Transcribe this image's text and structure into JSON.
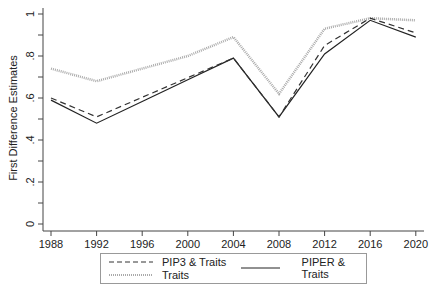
{
  "chart_data": {
    "type": "line",
    "title": "",
    "xlabel": "",
    "ylabel": "First Difference Estimates",
    "x": [
      1988,
      1992,
      1996,
      2000,
      2004,
      2008,
      2012,
      2016,
      2020
    ],
    "x_tick_labels": [
      "1988",
      "1992",
      "1996",
      "2000",
      "2004",
      "2008",
      "2012",
      "2016",
      "2020"
    ],
    "y_tick_labels": [
      "0",
      ".2",
      ".4",
      ".6",
      ".8",
      "1"
    ],
    "ylim": [
      0,
      1
    ],
    "grid": false,
    "legend_position": "bottom",
    "series": [
      {
        "name": "PIP3 & Traits",
        "style": "dashed",
        "color": "#333333",
        "values": [
          0.6,
          0.51,
          null,
          null,
          0.79,
          0.51,
          0.85,
          0.98,
          0.91
        ]
      },
      {
        "name": "PIPER & Traits",
        "style": "solid",
        "color": "#222222",
        "values": [
          0.59,
          0.48,
          null,
          null,
          0.79,
          0.51,
          0.81,
          0.97,
          0.89
        ]
      },
      {
        "name": "Traits",
        "style": "dotted",
        "color": "#aaaaaa",
        "values": [
          0.74,
          0.68,
          null,
          0.8,
          0.89,
          0.62,
          0.93,
          0.98,
          0.97
        ]
      }
    ]
  },
  "legend": {
    "items": [
      "PIP3 & Traits",
      "PIPER & Traits",
      "Traits"
    ]
  }
}
